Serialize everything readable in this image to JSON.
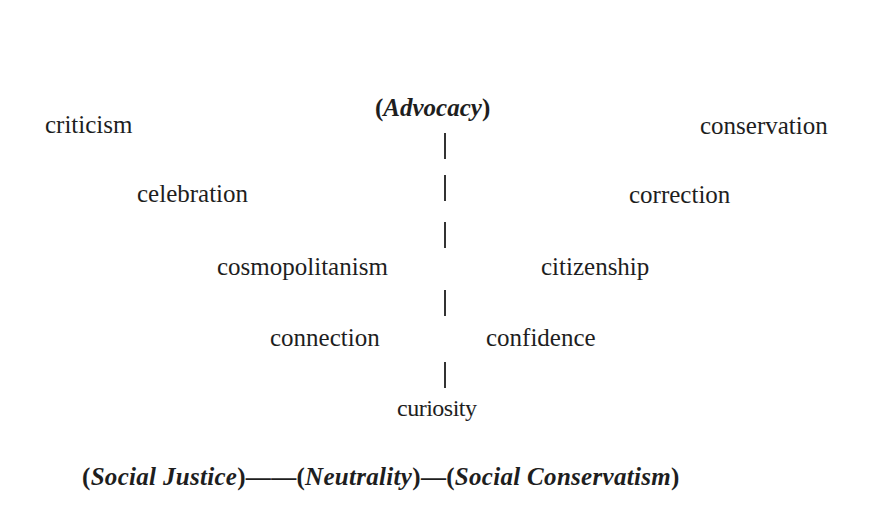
{
  "diagram": {
    "top_label": "Advocacy",
    "bottom_axis": {
      "left": "Social Justice",
      "center": "Neutrality",
      "right": "Social Conservatism",
      "connector_long": "——",
      "connector_short": "—"
    },
    "left_terms": [
      "criticism",
      "celebration",
      "cosmopolitanism",
      "connection"
    ],
    "right_terms": [
      "conservation",
      "correction",
      "citizenship",
      "confidence"
    ],
    "bottom_term": "curiosity"
  }
}
